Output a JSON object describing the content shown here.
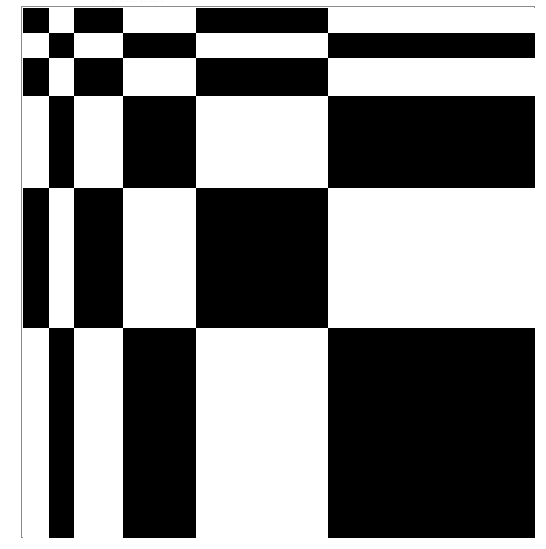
{
  "figure": {
    "caption_remnant": "· ·  ··· ·· ·· ·",
    "background_color": "#ffffff",
    "frame_border_color": "#8c8c8c",
    "frame": {
      "x": 21,
      "y": 6,
      "width": 514,
      "height": 532
    }
  },
  "chart_data": {
    "type": "heatmap",
    "title": "",
    "subtitle": "",
    "xlabel": "",
    "ylabel": "",
    "legend": [],
    "grid": false,
    "colors": {
      "on": "#000000",
      "off": "#ffffff"
    },
    "value_labels": {
      "0": "white",
      "1": "black"
    },
    "n_columns": 6,
    "n_rows": 6,
    "column_edges": [
      22,
      48,
      73,
      122,
      195,
      327,
      534
    ],
    "row_edges": [
      7,
      32,
      57,
      95,
      187,
      327,
      537
    ],
    "column_widths": [
      26,
      25,
      49,
      73,
      132,
      207
    ],
    "row_heights": [
      25,
      25,
      38,
      92,
      140,
      210
    ],
    "x": [
      "c1",
      "c2",
      "c3",
      "c4",
      "c5",
      "c6"
    ],
    "categories": [
      "r1",
      "r2",
      "r3",
      "r4",
      "r5",
      "r6"
    ],
    "values": [
      [
        1,
        0,
        1,
        0,
        1,
        0
      ],
      [
        0,
        1,
        0,
        1,
        0,
        1
      ],
      [
        1,
        0,
        1,
        0,
        1,
        0
      ],
      [
        0,
        1,
        0,
        1,
        0,
        1
      ],
      [
        1,
        0,
        1,
        0,
        1,
        0
      ],
      [
        0,
        1,
        0,
        1,
        0,
        1
      ]
    ],
    "series": [
      {
        "name": "r1",
        "values": [
          1,
          0,
          1,
          0,
          1,
          0
        ]
      },
      {
        "name": "r2",
        "values": [
          0,
          1,
          0,
          1,
          0,
          1
        ]
      },
      {
        "name": "r3",
        "values": [
          1,
          0,
          1,
          0,
          1,
          0
        ]
      },
      {
        "name": "r4",
        "values": [
          0,
          1,
          0,
          1,
          0,
          1
        ]
      },
      {
        "name": "r5",
        "values": [
          1,
          0,
          1,
          0,
          1,
          0
        ]
      },
      {
        "name": "r6",
        "values": [
          0,
          1,
          0,
          1,
          0,
          1
        ]
      }
    ],
    "xlim": [
      22,
      534
    ],
    "ylim": [
      7,
      537
    ],
    "annotations": []
  }
}
